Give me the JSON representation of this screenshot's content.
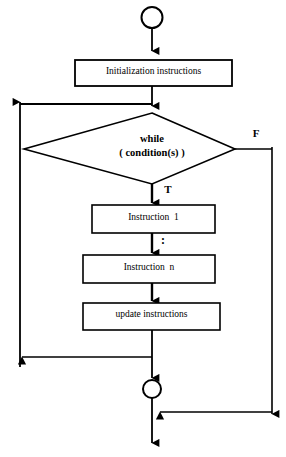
{
  "diagram": {
    "type": "flowchart",
    "background_color": "#ffffff",
    "stroke_color": "#000000",
    "nodes": {
      "start": {
        "shape": "circle",
        "label": ""
      },
      "init": {
        "shape": "process",
        "label": "Initialization instructions"
      },
      "decision": {
        "shape": "diamond",
        "label_line1": "while",
        "label_line2": "( condition(s) )"
      },
      "instruction_first": {
        "shape": "process",
        "label": "Instruction  1"
      },
      "ellipsis": {
        "shape": "text",
        "label": ":"
      },
      "instruction_last": {
        "shape": "process",
        "label": "Instruction  n"
      },
      "update": {
        "shape": "process",
        "label": "update instructions"
      },
      "merge": {
        "shape": "circle",
        "label": ""
      }
    },
    "edge_labels": {
      "true_branch": "T",
      "false_branch": "F"
    }
  }
}
